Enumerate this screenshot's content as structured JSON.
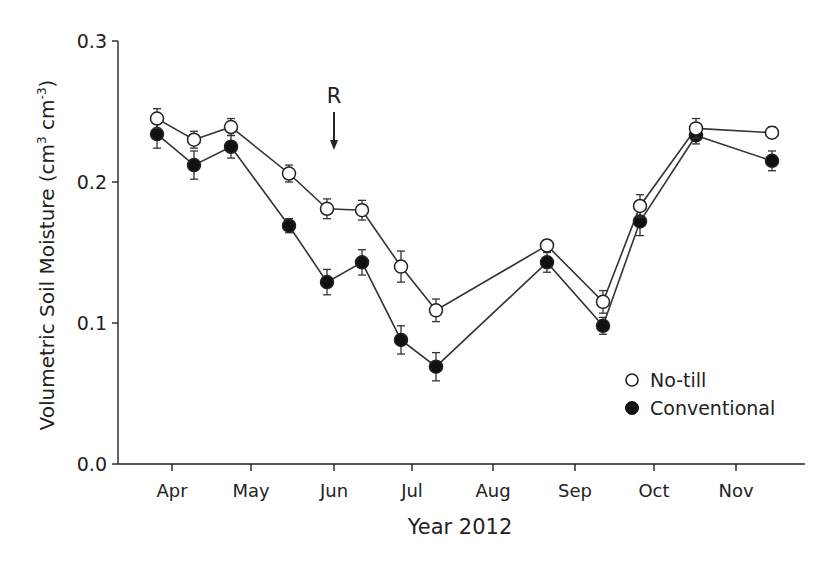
{
  "chart_data": {
    "type": "line",
    "title": "",
    "xlabel": "Year 2012",
    "ylabel": "Volumetric Soil Moisture (cm3 cm-3)",
    "ylabel_parts": {
      "main": "Volumetric Soil Moisture (cm",
      "sup1": "3",
      "mid": " cm",
      "sup2": "-3",
      "end": ")"
    },
    "ylim": [
      0.0,
      0.3
    ],
    "yticks": [
      0.0,
      0.1,
      0.2,
      0.3
    ],
    "ytick_labels": [
      "0.0",
      "0.1",
      "0.2",
      "0.3"
    ],
    "xtick_labels": [
      "Apr",
      "May",
      "Jun",
      "Jul",
      "Aug",
      "Sep",
      "Oct",
      "Nov"
    ],
    "xtick_pos": [
      172,
      251,
      334,
      412,
      493,
      575,
      654,
      736
    ],
    "grid": false,
    "legend_position": "lower right",
    "annotation": {
      "text": "R",
      "x_px": 334,
      "note": "downward arrow marking early June"
    },
    "x_px": [
      157,
      194,
      231,
      289,
      327,
      362,
      401,
      436,
      547,
      603,
      640,
      696,
      772
    ],
    "series": [
      {
        "name": "No-till",
        "marker": "open-circle",
        "values": [
          0.245,
          0.23,
          0.239,
          0.206,
          0.181,
          0.18,
          0.14,
          0.109,
          0.155,
          0.115,
          0.183,
          0.238,
          0.235
        ],
        "errors": [
          0.007,
          0.006,
          0.006,
          0.006,
          0.007,
          0.007,
          0.011,
          0.008,
          0.004,
          0.008,
          0.008,
          0.007,
          0.004
        ]
      },
      {
        "name": "Conventional",
        "marker": "filled-circle",
        "values": [
          0.234,
          0.212,
          0.225,
          0.169,
          0.129,
          0.143,
          0.088,
          0.069,
          0.143,
          0.098,
          0.172,
          0.233,
          0.215
        ],
        "errors": [
          0.01,
          0.01,
          0.008,
          0.005,
          0.009,
          0.009,
          0.01,
          0.01,
          0.007,
          0.006,
          0.01,
          0.006,
          0.007
        ]
      }
    ]
  }
}
